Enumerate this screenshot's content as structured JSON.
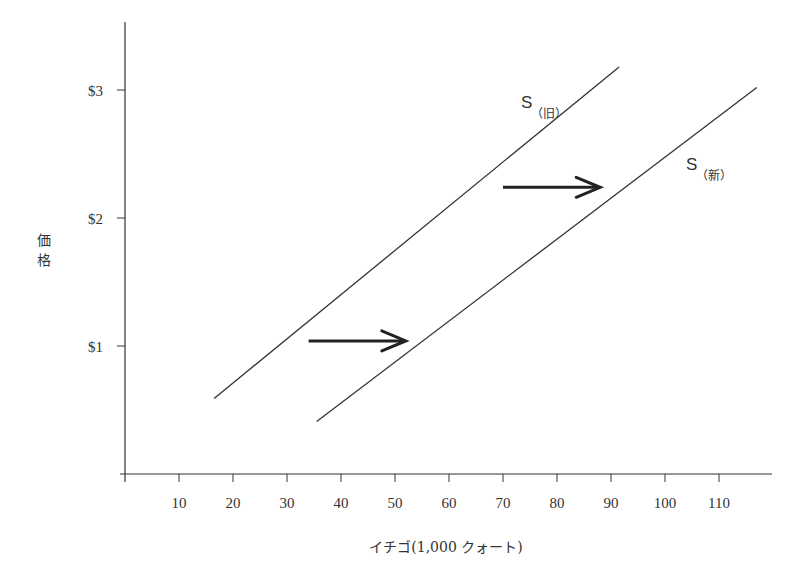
{
  "chart_data": {
    "type": "line",
    "title": "",
    "xlabel": "イチゴ(1,000 クォート)",
    "ylabel": "価格",
    "x_ticks": [
      10,
      20,
      30,
      40,
      50,
      60,
      70,
      80,
      90,
      100,
      110
    ],
    "x_tick_labels": [
      "10",
      "20",
      "30",
      "40",
      "50",
      "60",
      "70",
      "80",
      "90",
      "100",
      "110"
    ],
    "y_ticks": [
      1,
      2,
      3
    ],
    "y_tick_labels": [
      "$1",
      "$2",
      "$3"
    ],
    "xlim": [
      0,
      118
    ],
    "ylim": [
      0,
      3.5
    ],
    "grid": false,
    "series": [
      {
        "name": "S (旧)",
        "label_main": "S",
        "label_sub": "（旧）",
        "x": [
          16.5,
          91.5
        ],
        "y": [
          0.59,
          3.18
        ]
      },
      {
        "name": "S (新)",
        "label_main": "S",
        "label_sub": "（新）",
        "x": [
          35.5,
          117
        ],
        "y": [
          0.41,
          3.02
        ]
      }
    ],
    "annotations": [
      {
        "type": "arrow",
        "from": [
          34,
          1.04
        ],
        "to": [
          52,
          1.04
        ],
        "meaning": "supply shift right"
      },
      {
        "type": "arrow",
        "from": [
          70,
          2.24
        ],
        "to": [
          88,
          2.24
        ],
        "meaning": "supply shift right"
      }
    ]
  },
  "colors": {
    "line": "#333333",
    "text": "#333333",
    "background": "#ffffff"
  }
}
